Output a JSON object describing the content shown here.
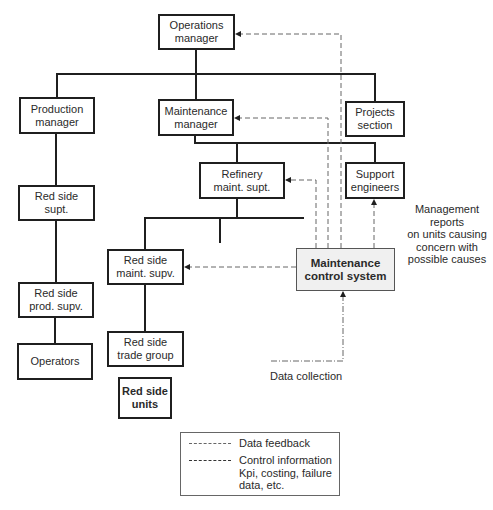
{
  "nodes": {
    "operations_manager": "Operations\nmanager",
    "production_manager": "Production\nmanager",
    "maintenance_manager": "Maintenance\nmanager",
    "projects_section": "Projects\nsection",
    "refinery_maint_supt": "Refinery\nmaint. supt.",
    "support_engineers": "Support\nengineers",
    "red_side_supt": "Red side\nsupt.",
    "red_side_maint_supv": "Red side\nmaint. supv.",
    "maintenance_control_system": "Maintenance\ncontrol system",
    "red_side_prod_supv": "Red side\nprod. supv.",
    "red_side_trade_group": "Red side\ntrade group",
    "operators": "Operators",
    "red_side_units": "Red side\nunits"
  },
  "annotations": {
    "management_reports": "Management\nreports\non units causing\nconcern with\npossible causes",
    "data_collection": "Data collection"
  },
  "legend": {
    "items": [
      {
        "style": "dash-dot",
        "label": "Data feedback"
      },
      {
        "style": "dashed",
        "label": "Control information\nKpi, costing, failure\ndata, etc."
      }
    ]
  },
  "colors": {
    "line": "#1f1f1f",
    "dashed": "#666666",
    "mcs_fill": "#f0f0f0"
  }
}
